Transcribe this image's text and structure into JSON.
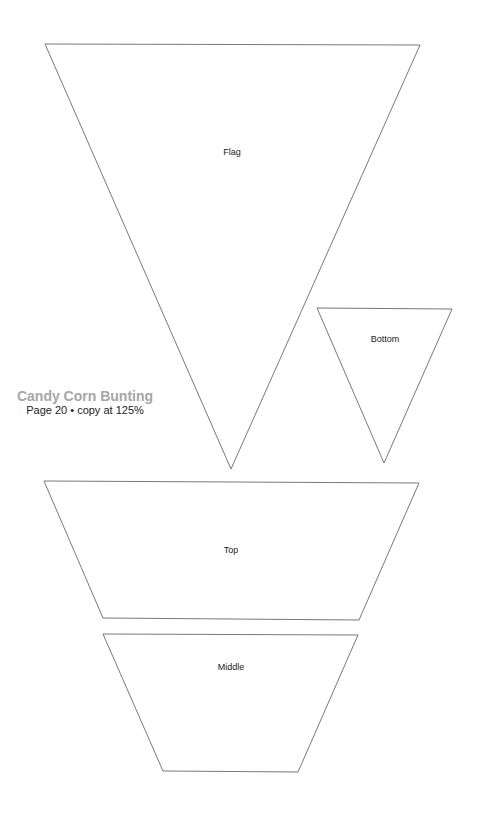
{
  "document": {
    "title": "Candy Corn Bunting",
    "subtitle": "Page 20 • copy at 125%"
  },
  "pieces": [
    {
      "name": "Flag",
      "shape": "triangle",
      "points": "45,44 420,45 231,469",
      "label_x": 232,
      "label_y": 147
    },
    {
      "name": "Bottom",
      "shape": "triangle",
      "points": "317,308 452,309 384,463",
      "label_x": 385,
      "label_y": 334
    },
    {
      "name": "Top",
      "shape": "trapezoid",
      "points": "44,481 419,483 359,620 103,618",
      "label_x": 231,
      "label_y": 545
    },
    {
      "name": "Middle",
      "shape": "trapezoid",
      "points": "103,634 358,635 298,772 163,771",
      "label_x": 231,
      "label_y": 662
    }
  ],
  "style": {
    "stroke": "#555555",
    "title_color": "#a6a6a6"
  }
}
